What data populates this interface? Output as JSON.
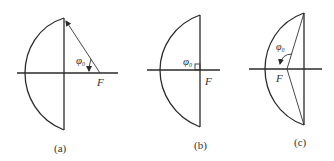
{
  "figures": [
    {
      "id": "a",
      "caption": "(a)",
      "angle_label": "φ",
      "angle_subscript": "0",
      "focus_label": "F",
      "description": "Half-circle reflector with focus outside aperture on axis; ray from F to rim top"
    },
    {
      "id": "b",
      "caption": "(b)",
      "angle_label": "φ",
      "angle_subscript": "0",
      "focus_label": "F",
      "description": "Half-circle reflector with focus at aperture plane; right-angle marker"
    },
    {
      "id": "c",
      "caption": "(c)",
      "angle_label": "φ",
      "angle_subscript": "0",
      "focus_label": "F",
      "description": "Half-circle reflector with focus inside; rays from F to both rim edges"
    }
  ]
}
